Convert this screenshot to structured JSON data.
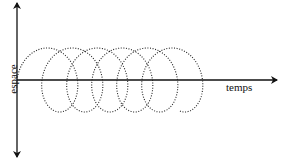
{
  "diagram": {
    "x_axis_label": "temps",
    "y_axis_label": "espace",
    "axes": {
      "origin": [
        17,
        80
      ],
      "x_end": 277,
      "y_top": 3,
      "y_bottom": 157,
      "color": "#111111"
    },
    "curve": {
      "type": "prolate-trochoid",
      "style": "dotted",
      "color": "#222222",
      "start_x": 17,
      "baseline_y": 80,
      "advance_per_turn": 25,
      "radius_x": 24,
      "radius_y": 32,
      "turns": 5.8
    }
  }
}
